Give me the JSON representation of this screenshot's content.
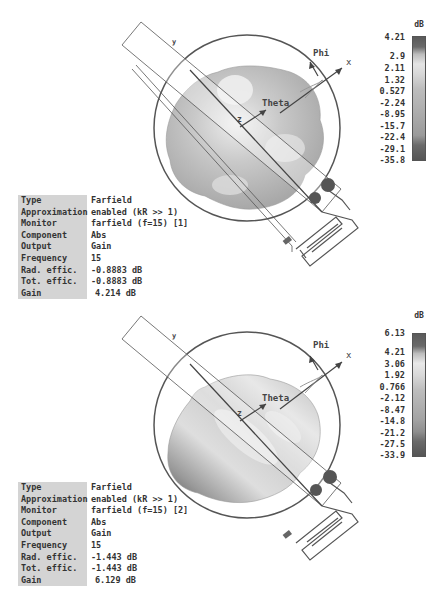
{
  "panels": [
    {
      "id": "top",
      "colorbar": {
        "unit": "dB",
        "labels": [
          "4.21",
          "2.9",
          "2.11",
          "1.32",
          "0.527",
          "-2.24",
          "-8.95",
          "-15.7",
          "-22.4",
          "-29.1",
          "-35.8"
        ]
      },
      "axes": {
        "phi": "Phi",
        "theta": "Theta",
        "x": "x",
        "y": "y",
        "z": "z"
      },
      "info": [
        {
          "key": "Type",
          "value": "Farfield"
        },
        {
          "key": "Approximation",
          "value": "enabled (kR >> 1)"
        },
        {
          "key": "Monitor",
          "value": "farfield (f=15) [1]"
        },
        {
          "key": "Component",
          "value": "Abs"
        },
        {
          "key": "Output",
          "value": "Gain"
        },
        {
          "key": "Frequency",
          "value": "15"
        },
        {
          "key": "Rad. effic.",
          "value": "-0.8883 dB"
        },
        {
          "key": "Tot. effic.",
          "value": "-0.8883 dB"
        },
        {
          "key": "Gain",
          "value": "4.214 dB"
        }
      ]
    },
    {
      "id": "bottom",
      "colorbar": {
        "unit": "dB",
        "labels": [
          "6.13",
          "4.21",
          "3.06",
          "1.92",
          "0.766",
          "-2.12",
          "-8.47",
          "-14.8",
          "-21.2",
          "-27.5",
          "-33.9"
        ]
      },
      "axes": {
        "phi": "Phi",
        "theta": "Theta",
        "x": "x",
        "y": "y",
        "z": "z"
      },
      "info": [
        {
          "key": "Type",
          "value": "Farfield"
        },
        {
          "key": "Approximation",
          "value": "enabled (kR >> 1)"
        },
        {
          "key": "Monitor",
          "value": "farfield (f=15) [2]"
        },
        {
          "key": "Component",
          "value": "Abs"
        },
        {
          "key": "Output",
          "value": "Gain"
        },
        {
          "key": "Frequency",
          "value": "15"
        },
        {
          "key": "Rad. effic.",
          "value": "-1.443 dB"
        },
        {
          "key": "Tot. effic.",
          "value": "-1.443 dB"
        },
        {
          "key": "Gain",
          "value": "6.129 dB"
        }
      ]
    }
  ],
  "port_labels": [
    "1",
    "2"
  ]
}
